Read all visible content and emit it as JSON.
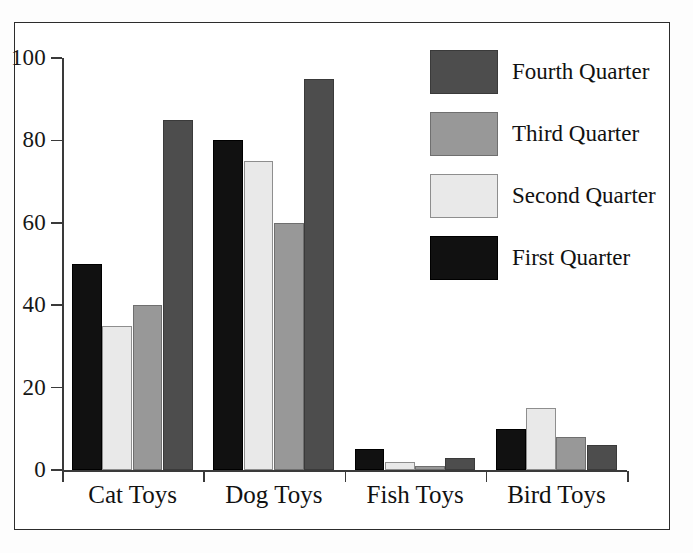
{
  "chart_data": {
    "type": "bar",
    "title": "",
    "subtitle": "",
    "xlabel": "",
    "ylabel": "",
    "ylim": [
      0,
      100
    ],
    "y_ticks": [
      0,
      20,
      40,
      60,
      80,
      100
    ],
    "grid": false,
    "legend_position": "right",
    "grouping": "grouped",
    "categories": [
      "Cat Toys",
      "Dog Toys",
      "Fish Toys",
      "Bird Toys"
    ],
    "series": [
      {
        "name": "First Quarter",
        "color": "#111111",
        "values": [
          50,
          80,
          5,
          10
        ]
      },
      {
        "name": "Second Quarter",
        "color": "#e9e9e9",
        "values": [
          35,
          75,
          2,
          15
        ]
      },
      {
        "name": "Third Quarter",
        "color": "#989898",
        "values": [
          40,
          60,
          1,
          8
        ]
      },
      {
        "name": "Fourth Quarter",
        "color": "#4d4d4d",
        "values": [
          85,
          95,
          3,
          6
        ]
      }
    ],
    "legend_order": [
      "Fourth Quarter",
      "Third Quarter",
      "Second Quarter",
      "First Quarter"
    ]
  },
  "axis": {
    "y_tick_labels": [
      "100",
      "80",
      "60",
      "40",
      "20",
      "0"
    ]
  },
  "legend": {
    "entries": [
      {
        "label": "Fourth Quarter",
        "swatch": "q4"
      },
      {
        "label": "Third Quarter",
        "swatch": "q3"
      },
      {
        "label": "Second Quarter",
        "swatch": "q2"
      },
      {
        "label": "First Quarter",
        "swatch": "q1"
      }
    ]
  },
  "colors": {
    "first_quarter": "#111111",
    "second_quarter": "#e9e9e9",
    "third_quarter": "#989898",
    "fourth_quarter": "#4d4d4d",
    "axis": "#3a3a3a",
    "frame": "#2c2c2c",
    "background": "#ffffff"
  }
}
